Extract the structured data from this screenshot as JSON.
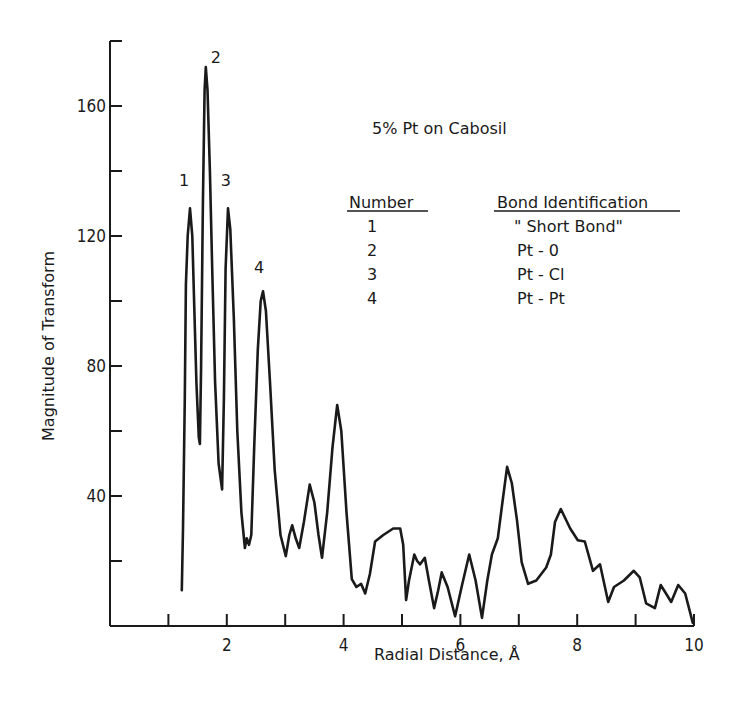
{
  "chart_data": {
    "type": "line",
    "title": "5% Pt on Cabosil",
    "xlabel": "Radial Distance, Å",
    "ylabel": "Magnitude of Transform",
    "xlim": [
      0,
      10
    ],
    "ylim": [
      0,
      180
    ],
    "x_ticks": [
      1,
      2,
      3,
      4,
      5,
      6,
      7,
      8,
      9,
      10
    ],
    "x_tick_labels": [
      "2",
      "4",
      "6",
      "8",
      "10"
    ],
    "x_tick_label_values": [
      2,
      4,
      6,
      8,
      10
    ],
    "y_ticks": [
      20,
      40,
      60,
      80,
      100,
      120,
      140,
      160,
      180
    ],
    "y_tick_labels": [
      "40",
      "80",
      "120",
      "160"
    ],
    "y_tick_label_values": [
      40,
      80,
      120,
      160
    ],
    "grid": false,
    "series": [
      {
        "name": "5% Pt on Cabosil",
        "x": [
          1.23,
          1.25,
          1.28,
          1.3,
          1.33,
          1.37,
          1.41,
          1.44,
          1.48,
          1.52,
          1.54,
          1.56,
          1.59,
          1.62,
          1.64,
          1.67,
          1.71,
          1.75,
          1.8,
          1.86,
          1.92,
          1.95,
          1.98,
          2.02,
          2.06,
          2.12,
          2.18,
          2.25,
          2.31,
          2.34,
          2.38,
          2.42,
          2.47,
          2.53,
          2.58,
          2.62,
          2.67,
          2.74,
          2.82,
          2.92,
          3.01,
          3.07,
          3.12,
          3.18,
          3.24,
          3.32,
          3.42,
          3.5,
          3.57,
          3.63,
          3.72,
          3.81,
          3.89,
          3.96,
          4.05,
          4.14,
          4.22,
          4.3,
          4.37,
          4.45,
          4.54,
          4.68,
          4.85,
          4.97,
          5.02,
          5.07,
          5.12,
          5.21,
          5.26,
          5.31,
          5.39,
          5.46,
          5.55,
          5.62,
          5.68,
          5.78,
          5.91,
          6.02,
          6.15,
          6.26,
          6.37,
          6.46,
          6.54,
          6.64,
          6.72,
          6.8,
          6.88,
          6.97,
          7.05,
          7.16,
          7.3,
          7.47,
          7.55,
          7.62,
          7.72,
          7.8,
          7.88,
          8.01,
          8.13,
          8.27,
          8.39,
          8.53,
          8.63,
          8.8,
          8.97,
          9.07,
          9.18,
          9.33,
          9.43,
          9.52,
          9.61,
          9.73,
          9.85,
          9.98
        ],
        "y": [
          11,
          30,
          70,
          105,
          120,
          128.5,
          120,
          100,
          75,
          58,
          56,
          80,
          130,
          165,
          172,
          165,
          140,
          110,
          75,
          50,
          42,
          70,
          110,
          128.5,
          122,
          95,
          60,
          35,
          24,
          27,
          25,
          28,
          55,
          85,
          100,
          103,
          97,
          75,
          48,
          28,
          21.5,
          28,
          31,
          27,
          24,
          32,
          43.5,
          38,
          28,
          21,
          35,
          55,
          68,
          60,
          35,
          14.4,
          12,
          13,
          10,
          16,
          26,
          28,
          30,
          30,
          25,
          8,
          14,
          22,
          20,
          19,
          21,
          14,
          5.5,
          11,
          16.5,
          12,
          3,
          12,
          22,
          14,
          2.5,
          14,
          22,
          27,
          38,
          49,
          44,
          32.5,
          19.6,
          13,
          14,
          18,
          22,
          32,
          36,
          33,
          30,
          26.4,
          26,
          17,
          19,
          7.4,
          12,
          14,
          17,
          15,
          7,
          5.5,
          12.6,
          10,
          7.4,
          12.6,
          10,
          1
        ]
      }
    ],
    "annotations": [
      {
        "label": "1",
        "x": 1.37,
        "y": 128.5
      },
      {
        "label": "2",
        "x": 1.64,
        "y": 172
      },
      {
        "label": "3",
        "x": 2.02,
        "y": 128.5
      },
      {
        "label": "4",
        "x": 2.62,
        "y": 103
      }
    ],
    "legend_table": {
      "headers": [
        "Number",
        "Bond Identification"
      ],
      "rows": [
        {
          "number": "1",
          "bond": "\" Short Bond\""
        },
        {
          "number": "2",
          "bond": "Pt - 0"
        },
        {
          "number": "3",
          "bond": "Pt - Cl"
        },
        {
          "number": "4",
          "bond": "Pt - Pt"
        }
      ]
    }
  },
  "colors": {
    "ink": "#1a1a1a",
    "background": "#ffffff"
  }
}
